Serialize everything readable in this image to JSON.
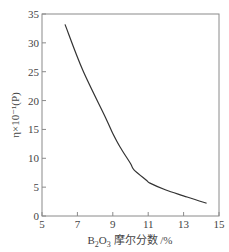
{
  "chart_data": {
    "type": "line",
    "title": "",
    "xlabel": "B2O3摩尔分数/%",
    "xlabel_parts": {
      "main": "B",
      "sub1": "2",
      "mid": "O",
      "sub2": "3",
      "rest": " 摩尔分数 /%"
    },
    "ylabel": "η×10⁻¹(P)",
    "xlim": [
      5,
      15
    ],
    "ylim": [
      0,
      35
    ],
    "xticks": [
      5,
      7,
      9,
      11,
      13,
      15
    ],
    "yticks": [
      0,
      5,
      10,
      15,
      20,
      25,
      30,
      35
    ],
    "grid": false,
    "legend": null,
    "series": [
      {
        "name": "viscosity",
        "color": "#333333",
        "x": [
          6.3,
          7.3,
          8.6,
          9.0,
          9.4,
          10.0,
          10.2,
          10.9,
          11.1,
          12.0,
          13.2,
          14.3
        ],
        "y": [
          33.2,
          25.3,
          17.0,
          14.3,
          12.0,
          9.1,
          8.0,
          6.2,
          5.7,
          4.5,
          3.3,
          2.2
        ]
      }
    ]
  }
}
